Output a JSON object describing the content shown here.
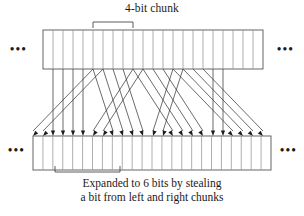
{
  "figure": {
    "title": "4-bit chunk",
    "caption_line1": "Expanded to 6 bits by stealing",
    "caption_line2": "a bit from left and right chunks",
    "ellipsis": "•••",
    "top_row": {
      "name": "input-bit-row",
      "cell_count": 22,
      "x_start": 43,
      "x_end": 263,
      "y_top": 30,
      "y_bottom": 69,
      "cell_width": 10
    },
    "bottom_row": {
      "name": "expanded-bit-row",
      "cell_count": 24,
      "x_start": 33,
      "x_end": 271,
      "y_top": 136,
      "y_bottom": 170,
      "cell_width": 9.9166
    },
    "top_bracket": {
      "x_left": 93,
      "x_right": 133,
      "y": 22,
      "tick": 6
    },
    "bottom_bracket": {
      "x_left": 55,
      "x_right": 120,
      "y": 172,
      "tick": 6
    },
    "arrows": {
      "count": 24,
      "y_from": 69,
      "y_to": 136,
      "description": "DES expansion permutation: each 4-bit chunk expands to 6 bits by stealing one bit from the left and right neighbouring chunks",
      "pairs": [
        [
          93,
          33
        ],
        [
          103,
          43
        ],
        [
          53,
          53
        ],
        [
          63,
          63
        ],
        [
          73,
          73
        ],
        [
          83,
          83
        ],
        [
          133,
          93
        ],
        [
          143,
          103
        ],
        [
          93,
          113
        ],
        [
          103,
          123
        ],
        [
          113,
          133
        ],
        [
          123,
          143
        ],
        [
          173,
          153
        ],
        [
          183,
          163
        ],
        [
          133,
          173
        ],
        [
          143,
          183
        ],
        [
          153,
          193
        ],
        [
          163,
          203
        ],
        [
          213,
          213
        ],
        [
          223,
          223
        ],
        [
          173,
          233
        ],
        [
          183,
          243
        ],
        [
          193,
          253
        ],
        [
          203,
          263
        ]
      ]
    },
    "colors": {
      "outline": "#555555",
      "divider": "#9a9a9a",
      "arrow": "#3a3a3a",
      "arrow_head": "#1d1d1d",
      "bracket": "#4a4a4a",
      "text": "#1a1a1a",
      "background": "#ffffff"
    }
  }
}
